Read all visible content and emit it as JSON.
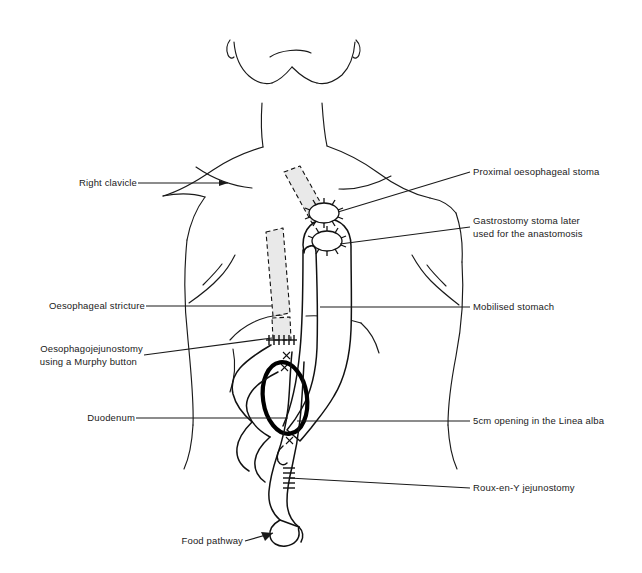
{
  "figure": {
    "background_color": "#ffffff",
    "line_color": "#1a1a1a",
    "shade_color": "#e9e9e9",
    "width": 642,
    "height": 573
  },
  "labels": {
    "right_clavicle": "Right clavicle",
    "oesophageal_stricture": "Oesophageal stricture",
    "oesophagojejunostomy_line1": "Oesophagojejunostomy",
    "oesophagojejunostomy_line2": "using a Murphy button",
    "duodenum": "Duodenum",
    "food_pathway": "Food pathway",
    "proximal_oesophageal_stoma": "Proximal oesophageal stoma",
    "gastrostomy_stoma_line1": "Gastrostomy stoma later",
    "gastrostomy_stoma_line2": "used for the anastomosis",
    "mobilised_stomach": "Mobilised stomach",
    "linea_alba_opening": "5cm opening in the Linea alba",
    "roux_en_y_jejunostomy": "Roux-en-Y jejunostomy"
  },
  "anatomy": {
    "head": "head-and-neck-outline",
    "torso": "torso-outline",
    "clavicle": "clavicle-outline",
    "ribcage": "costal-margin-outline",
    "stomach": "mobilised-stomach-outline",
    "oesophagus_upper": "upper-oesophagus-shaded-segment",
    "oesophagus_lower": "lower-oesophagus-shaded-segment",
    "duodenum": "duodenal-loop",
    "jejunum": "roux-limb-jejunum",
    "linea_alba": "linea-alba-opening-ring",
    "stoma_proximal": "proximal-oesophageal-stoma-ring",
    "stoma_gastrostomy": "gastrostomy-stoma-ring",
    "anastomosis": "murphy-button-anastomosis-sutures",
    "jejunostomy_sutures": "roux-en-y-jejunostomy-sutures"
  }
}
